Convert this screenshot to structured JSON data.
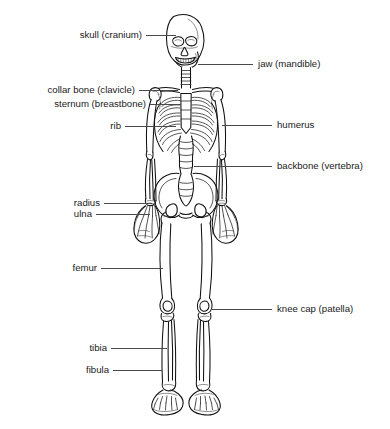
{
  "diagram": {
    "background_color": "#ffffff",
    "line_color": "#111111",
    "leader_color": "#4a4a4a",
    "text_color": "#1a1a1a"
  },
  "labels": {
    "skull": "skull (cranium)",
    "clavicle": "collar bone (clavicle)",
    "sternum": "sternum (breastbone)",
    "rib": "rib",
    "radius": "radius",
    "ulna": "ulna",
    "femur": "femur",
    "tibia": "tibia",
    "fibula": "fibula",
    "jaw": "jaw (mandible)",
    "humerus": "humerus",
    "backbone": "backbone (vertebra)",
    "patella": "knee cap (patella)"
  }
}
